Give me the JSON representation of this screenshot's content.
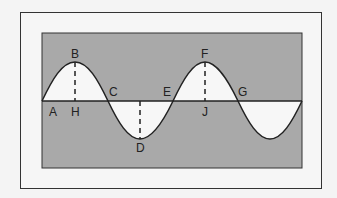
{
  "diagram": {
    "type": "transverse-wave",
    "colors": {
      "panel": "#a9a9a9",
      "wave_fill": "#f7f7f7",
      "line": "#222222",
      "background": "#f4f4f4"
    },
    "labels": {
      "A": "A",
      "B": "B",
      "C": "C",
      "D": "D",
      "E": "E",
      "F": "F",
      "G": "G",
      "H": "H",
      "J": "J"
    },
    "points": [
      {
        "id": "A",
        "description": "start point on rest line"
      },
      {
        "id": "B",
        "description": "crest"
      },
      {
        "id": "C",
        "description": "crossing rest line"
      },
      {
        "id": "D",
        "description": "trough"
      },
      {
        "id": "E",
        "description": "crossing rest line"
      },
      {
        "id": "F",
        "description": "crest"
      },
      {
        "id": "G",
        "description": "crossing rest line"
      },
      {
        "id": "H",
        "description": "rest line below crest B"
      },
      {
        "id": "J",
        "description": "rest line below crest F"
      }
    ]
  }
}
